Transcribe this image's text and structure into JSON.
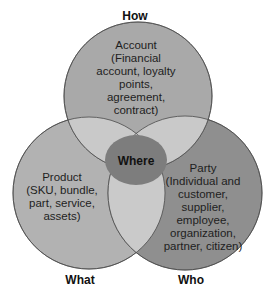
{
  "diagram": {
    "type": "venn",
    "axes": {
      "top": "How",
      "bottom_left": "What",
      "bottom_right": "Who"
    },
    "sets": [
      {
        "id": "account",
        "title": "Account",
        "lines": [
          "Account",
          "(Financial",
          "account, loyalty",
          "points,",
          "agreement,",
          "contract)"
        ],
        "color": "#a9a9a9"
      },
      {
        "id": "product",
        "title": "Product",
        "lines": [
          "Product",
          "(SKU, bundle,",
          "part, service,",
          "assets)"
        ],
        "color": "#b2b2b2"
      },
      {
        "id": "party",
        "title": "Party",
        "lines": [
          "Party",
          "(Individual and",
          "customer,",
          "supplier,",
          "employee,",
          "organization,",
          "partner, citizen)"
        ],
        "color": "#8f8f8f"
      }
    ],
    "center": {
      "label": "Where",
      "color": "#7d7d7d"
    },
    "overlap_color": "#c9c9c9"
  }
}
